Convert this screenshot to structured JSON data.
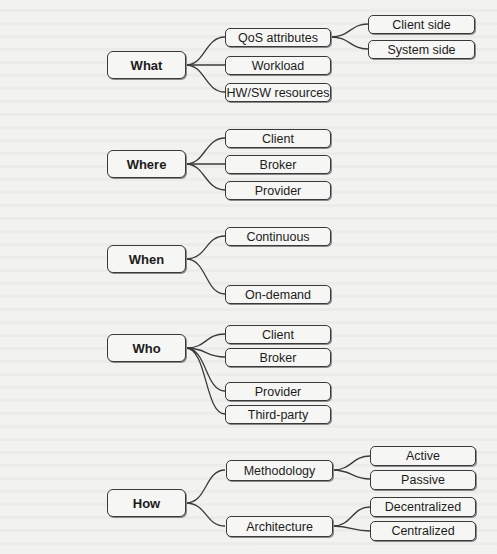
{
  "diagram": {
    "type": "taxonomy-tree",
    "colors": {
      "line": "#3a3a3a",
      "box_fill": "#f6f6f4",
      "background": "#f2f2f0",
      "text": "#1c1c1c"
    },
    "what": {
      "label": "What",
      "children": {
        "qos": {
          "label": "QoS attributes",
          "children": {
            "client_side": "Client side",
            "system_side": "System side"
          }
        },
        "workload": "Workload",
        "hwsw": "HW/SW resources"
      }
    },
    "where": {
      "label": "Where",
      "children": {
        "client": "Client",
        "broker": "Broker",
        "provider": "Provider"
      }
    },
    "when": {
      "label": "When",
      "children": {
        "continuous": "Continuous",
        "on_demand": "On-demand"
      }
    },
    "who": {
      "label": "Who",
      "children": {
        "client": "Client",
        "broker": "Broker",
        "provider": "Provider",
        "third_party": "Third-party"
      }
    },
    "how": {
      "label": "How",
      "children": {
        "methodology": {
          "label": "Methodology",
          "children": {
            "active": "Active",
            "passive": "Passive"
          }
        },
        "architecture": {
          "label": "Architecture",
          "children": {
            "decentralized": "Decentralized",
            "centralized": "Centralized"
          }
        }
      }
    }
  }
}
